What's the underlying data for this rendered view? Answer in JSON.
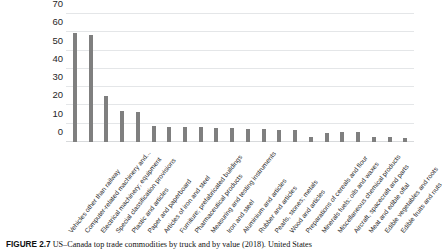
{
  "figure": {
    "number_label": "FIGURE 2.7",
    "caption_text": "US–Canada top trade commodities by truck and by value (2018). United States",
    "bar_color": "#7f7f7f",
    "gridline_color": "#e4e6e8"
  },
  "chart_data": {
    "type": "bar",
    "title": "",
    "xlabel": "",
    "ylabel": "US$ billions",
    "ylim": [
      0,
      70
    ],
    "ytick_step": 10,
    "yticks": [
      0,
      10,
      20,
      30,
      40,
      50,
      60,
      70
    ],
    "grid": true,
    "legend": "none",
    "categories": [
      "Vehicles other than railway",
      "Computer-related machinery and...",
      "Electrical machinery; equipment",
      "Special classification provisions",
      "Plastic and articles",
      "Paper and paperboard",
      "Articles of iron and steel",
      "Furniture; prefabricated buildings",
      "Pharmaceutical products",
      "Measuring and testing instruments",
      "Iron and steel",
      "Aluminium and articles",
      "Rubber and articles",
      "Pearls, stones; metals",
      "Wood and articles",
      "Preparations of cereals and flour",
      "Minerals fuels; oils and waxes",
      "Miscellaneous chemical products",
      "Aircraft, spacecraft and parts",
      "Meat and edible offal",
      "Edible vegetables and roots",
      "Edible fruits and nuts"
    ],
    "values": [
      59.5,
      58.5,
      25.2,
      17.0,
      16.2,
      8.6,
      8.4,
      8.2,
      8.0,
      7.8,
      7.4,
      7.2,
      7.0,
      6.8,
      6.6,
      3.0,
      5.0,
      5.6,
      5.4,
      2.8,
      2.6,
      2.2
    ],
    "ytick_labels": [
      "0",
      "10",
      "20",
      "30",
      "40",
      "50",
      "60",
      "70"
    ]
  }
}
